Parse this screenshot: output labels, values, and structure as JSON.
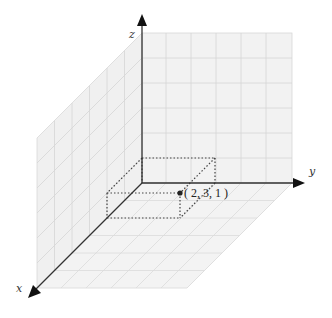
{
  "diagram": {
    "type": "3d-coordinate-system",
    "axes": {
      "x": {
        "label": "x"
      },
      "y": {
        "label": "y"
      },
      "z": {
        "label": "z"
      }
    },
    "point": {
      "coords": [
        2,
        3,
        1
      ],
      "label": "( 2, 3, 1 )"
    },
    "colors": {
      "axis": "#333333",
      "grid": "#d4d4d4",
      "plane_fill": "#f2f2f2",
      "dotted": "#444444",
      "point": "#222222"
    }
  }
}
